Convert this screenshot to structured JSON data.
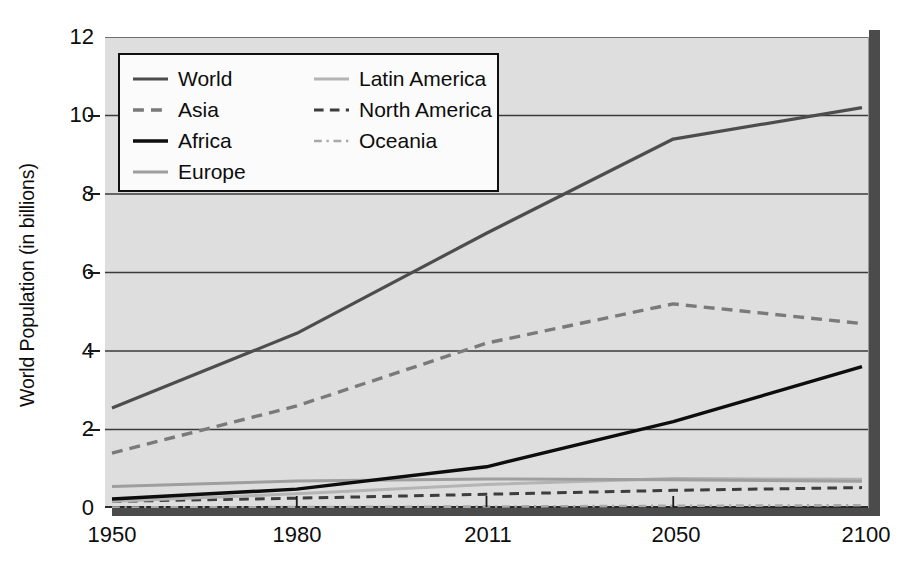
{
  "chart_data": {
    "type": "line",
    "title": "",
    "xlabel": "",
    "ylabel": "World Population (in billions)",
    "x": [
      1950,
      1980,
      2011,
      2050,
      2100
    ],
    "xtick_labels": [
      "1950",
      "1980",
      "2011",
      "2050",
      "2100"
    ],
    "ytick_labels": [
      "0",
      "2",
      "4",
      "6",
      "8",
      "10",
      "12"
    ],
    "yticks": [
      0,
      2,
      4,
      6,
      8,
      10,
      12
    ],
    "ylim": [
      0,
      12
    ],
    "grid": "horizontal",
    "legend_position": "upper-left-inside",
    "plot_background": "#dededf",
    "series": [
      {
        "name": "World",
        "color": "#4d4d4d",
        "style": "solid",
        "width": 3.2,
        "values": [
          2.55,
          4.45,
          7.0,
          9.4,
          10.2
        ]
      },
      {
        "name": "Asia",
        "color": "#7a7a7a",
        "style": "dashed",
        "width": 3.4,
        "values": [
          1.4,
          2.6,
          4.2,
          5.2,
          4.7
        ]
      },
      {
        "name": "Africa",
        "color": "#0d0d0d",
        "style": "solid",
        "width": 3.4,
        "values": [
          0.23,
          0.48,
          1.05,
          2.2,
          3.6
        ]
      },
      {
        "name": "Europe",
        "color": "#9e9e9e",
        "style": "solid",
        "width": 3.0,
        "values": [
          0.55,
          0.69,
          0.74,
          0.72,
          0.68
        ]
      },
      {
        "name": "Latin America",
        "color": "#b4b4b4",
        "style": "solid",
        "width": 3.0,
        "values": [
          0.17,
          0.36,
          0.6,
          0.75,
          0.73
        ]
      },
      {
        "name": "North America",
        "color": "#3d3d3d",
        "style": "dashed",
        "width": 3.0,
        "values": [
          0.17,
          0.25,
          0.35,
          0.45,
          0.52
        ]
      },
      {
        "name": "Oceania",
        "color": "#a8a8a8",
        "style": "dashdot",
        "width": 2.6,
        "values": [
          0.013,
          0.023,
          0.037,
          0.055,
          0.07
        ]
      }
    ]
  },
  "legend": {
    "columns": [
      [
        {
          "label": "World",
          "swatch": "line-solid-dark-gray"
        },
        {
          "label": "Asia",
          "swatch": "line-dashed-gray"
        },
        {
          "label": "Africa",
          "swatch": "line-solid-black"
        },
        {
          "label": "Europe",
          "swatch": "line-solid-light-gray"
        }
      ],
      [
        {
          "label": "Latin America",
          "swatch": "line-solid-pale-gray"
        },
        {
          "label": "North America",
          "swatch": "line-dashed-dark"
        },
        {
          "label": "Oceania",
          "swatch": "line-dashdot-gray"
        }
      ]
    ]
  }
}
